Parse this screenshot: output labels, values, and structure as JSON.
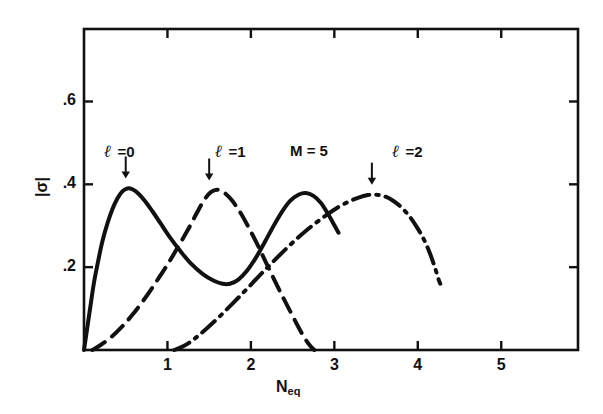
{
  "figure": {
    "background_color": "#ffffff",
    "ink_color": "#111111"
  },
  "axes": {
    "x_title_main": "N",
    "x_title_sub": "eq",
    "y_title": "|σ|",
    "x_tick_labels": [
      "1",
      "2",
      "3",
      "4",
      "5"
    ],
    "y_tick_labels": [
      ".2",
      ".4",
      ".6"
    ],
    "frame": {
      "left": 84,
      "right": 578,
      "top": 29,
      "bottom": 350
    }
  },
  "annotations": [
    {
      "id": "ann-l0",
      "symbol": "ℓ",
      "text": " =0"
    },
    {
      "id": "ann-l1",
      "symbol": "ℓ",
      "text": " =1"
    },
    {
      "id": "ann-m5",
      "symbol": "",
      "text": "M = 5"
    },
    {
      "id": "ann-l2",
      "symbol": "ℓ",
      "text": " =2"
    }
  ],
  "chart_data": {
    "type": "line",
    "title": "",
    "xlabel": "N_eq",
    "ylabel": "|sigma|",
    "xlim": [
      0,
      5.92
    ],
    "ylim": [
      0,
      0.775
    ],
    "xticks": [
      1,
      2,
      3,
      4,
      5
    ],
    "yticks": [
      0.2,
      0.4,
      0.6
    ],
    "grid": false,
    "legend_position": "inline-annotations",
    "annotation_arrows": [
      {
        "label": "l = 0",
        "x": 0.5,
        "y": 0.39
      },
      {
        "label": "l = 1",
        "x": 1.5,
        "y": 0.385
      },
      {
        "label": "l = 2",
        "x": 3.45,
        "y": 0.375
      }
    ],
    "parameter_label": "M = 5",
    "series": [
      {
        "name": "l = 0",
        "style": "solid",
        "points": [
          [
            0.0,
            0.0
          ],
          [
            0.04,
            0.055
          ],
          [
            0.08,
            0.11
          ],
          [
            0.12,
            0.163
          ],
          [
            0.17,
            0.215
          ],
          [
            0.22,
            0.262
          ],
          [
            0.28,
            0.305
          ],
          [
            0.34,
            0.34
          ],
          [
            0.4,
            0.366
          ],
          [
            0.46,
            0.383
          ],
          [
            0.52,
            0.39
          ],
          [
            0.58,
            0.388
          ],
          [
            0.65,
            0.378
          ],
          [
            0.73,
            0.36
          ],
          [
            0.82,
            0.335
          ],
          [
            0.92,
            0.305
          ],
          [
            1.03,
            0.272
          ],
          [
            1.15,
            0.24
          ],
          [
            1.28,
            0.209
          ],
          [
            1.42,
            0.184
          ],
          [
            1.55,
            0.168
          ],
          [
            1.66,
            0.16
          ],
          [
            1.75,
            0.16
          ],
          [
            1.85,
            0.17
          ],
          [
            1.96,
            0.193
          ],
          [
            2.07,
            0.226
          ],
          [
            2.17,
            0.262
          ],
          [
            2.27,
            0.299
          ],
          [
            2.37,
            0.333
          ],
          [
            2.47,
            0.36
          ],
          [
            2.57,
            0.375
          ],
          [
            2.66,
            0.379
          ],
          [
            2.75,
            0.372
          ],
          [
            2.84,
            0.355
          ],
          [
            2.92,
            0.33
          ],
          [
            2.99,
            0.305
          ],
          [
            3.05,
            0.283
          ]
        ]
      },
      {
        "name": "l = 1",
        "style": "dashed",
        "points": [
          [
            0.1,
            0.0
          ],
          [
            0.2,
            0.012
          ],
          [
            0.32,
            0.03
          ],
          [
            0.45,
            0.055
          ],
          [
            0.58,
            0.085
          ],
          [
            0.72,
            0.122
          ],
          [
            0.86,
            0.163
          ],
          [
            1.0,
            0.206
          ],
          [
            1.13,
            0.25
          ],
          [
            1.25,
            0.292
          ],
          [
            1.35,
            0.33
          ],
          [
            1.44,
            0.362
          ],
          [
            1.52,
            0.381
          ],
          [
            1.6,
            0.387
          ],
          [
            1.68,
            0.38
          ],
          [
            1.77,
            0.362
          ],
          [
            1.87,
            0.333
          ],
          [
            1.97,
            0.297
          ],
          [
            2.07,
            0.258
          ],
          [
            2.17,
            0.216
          ],
          [
            2.27,
            0.174
          ],
          [
            2.37,
            0.133
          ],
          [
            2.47,
            0.094
          ],
          [
            2.56,
            0.059
          ],
          [
            2.64,
            0.03
          ],
          [
            2.71,
            0.01
          ],
          [
            2.76,
            0.0
          ]
        ]
      },
      {
        "name": "l = 2",
        "style": "dash-dot",
        "points": [
          [
            1.08,
            0.0
          ],
          [
            1.2,
            0.01
          ],
          [
            1.33,
            0.028
          ],
          [
            1.47,
            0.052
          ],
          [
            1.62,
            0.08
          ],
          [
            1.78,
            0.112
          ],
          [
            1.94,
            0.145
          ],
          [
            2.1,
            0.179
          ],
          [
            2.26,
            0.212
          ],
          [
            2.42,
            0.244
          ],
          [
            2.58,
            0.274
          ],
          [
            2.74,
            0.301
          ],
          [
            2.9,
            0.325
          ],
          [
            3.04,
            0.344
          ],
          [
            3.17,
            0.358
          ],
          [
            3.29,
            0.368
          ],
          [
            3.4,
            0.374
          ],
          [
            3.5,
            0.375
          ],
          [
            3.6,
            0.371
          ],
          [
            3.7,
            0.361
          ],
          [
            3.8,
            0.345
          ],
          [
            3.9,
            0.323
          ],
          [
            4.0,
            0.293
          ],
          [
            4.08,
            0.264
          ],
          [
            4.15,
            0.231
          ],
          [
            4.21,
            0.196
          ],
          [
            4.25,
            0.17
          ],
          [
            4.27,
            0.16
          ]
        ]
      }
    ]
  }
}
